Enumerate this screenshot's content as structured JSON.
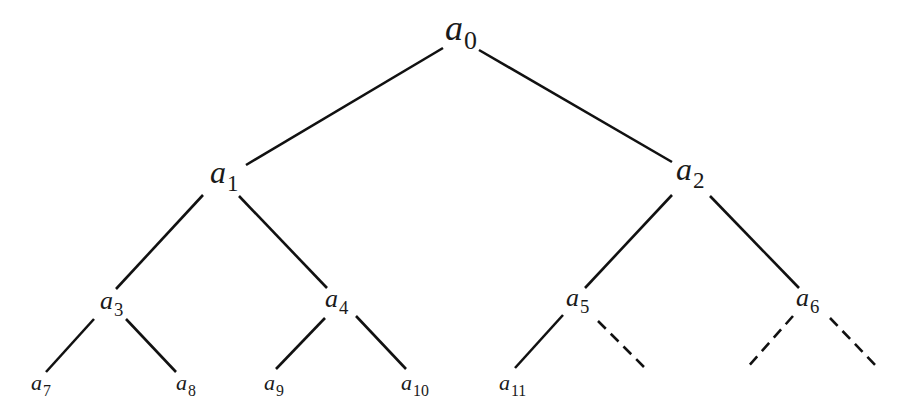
{
  "diagram": {
    "type": "binary-tree",
    "line_color": "#111111",
    "nodes": [
      {
        "id": "a0",
        "base": "a",
        "sub": "0",
        "x": 445,
        "y": 10,
        "size": 36
      },
      {
        "id": "a1",
        "base": "a",
        "sub": "1",
        "x": 210,
        "y": 156,
        "size": 32
      },
      {
        "id": "a2",
        "base": "a",
        "sub": "2",
        "x": 676,
        "y": 153,
        "size": 32
      },
      {
        "id": "a3",
        "base": "a",
        "sub": "3",
        "x": 100,
        "y": 288,
        "size": 26
      },
      {
        "id": "a4",
        "base": "a",
        "sub": "4",
        "x": 325,
        "y": 286,
        "size": 26
      },
      {
        "id": "a5",
        "base": "a",
        "sub": "5",
        "x": 566,
        "y": 285,
        "size": 26
      },
      {
        "id": "a6",
        "base": "a",
        "sub": "6",
        "x": 796,
        "y": 285,
        "size": 26
      },
      {
        "id": "a7",
        "base": "a",
        "sub": "7",
        "x": 31,
        "y": 372,
        "size": 22
      },
      {
        "id": "a8",
        "base": "a",
        "sub": "8",
        "x": 176,
        "y": 372,
        "size": 22
      },
      {
        "id": "a9",
        "base": "a",
        "sub": "9",
        "x": 264,
        "y": 372,
        "size": 22
      },
      {
        "id": "a10",
        "base": "a",
        "sub": "10",
        "x": 401,
        "y": 372,
        "size": 22
      },
      {
        "id": "a11",
        "base": "a",
        "sub": "11",
        "x": 499,
        "y": 372,
        "size": 22
      }
    ],
    "edges": [
      {
        "from": "a0",
        "to": "a1",
        "style": "solid",
        "x1": 443,
        "y1": 48,
        "x2": 246,
        "y2": 165
      },
      {
        "from": "a0",
        "to": "a2",
        "style": "solid",
        "x1": 479,
        "y1": 50,
        "x2": 672,
        "y2": 162
      },
      {
        "from": "a1",
        "to": "a3",
        "style": "solid",
        "x1": 203,
        "y1": 195,
        "x2": 116,
        "y2": 289
      },
      {
        "from": "a1",
        "to": "a4",
        "style": "solid",
        "x1": 239,
        "y1": 196,
        "x2": 327,
        "y2": 288
      },
      {
        "from": "a2",
        "to": "a5",
        "style": "solid",
        "x1": 672,
        "y1": 195,
        "x2": 585,
        "y2": 288
      },
      {
        "from": "a2",
        "to": "a6",
        "style": "solid",
        "x1": 710,
        "y1": 196,
        "x2": 799,
        "y2": 288
      },
      {
        "from": "a3",
        "to": "a7",
        "style": "solid",
        "x1": 94,
        "y1": 319,
        "x2": 46,
        "y2": 372
      },
      {
        "from": "a3",
        "to": "a8",
        "style": "solid",
        "x1": 126,
        "y1": 319,
        "x2": 176,
        "y2": 372
      },
      {
        "from": "a4",
        "to": "a9",
        "style": "solid",
        "x1": 325,
        "y1": 318,
        "x2": 276,
        "y2": 369
      },
      {
        "from": "a4",
        "to": "a10",
        "style": "solid",
        "x1": 356,
        "y1": 316,
        "x2": 406,
        "y2": 369
      },
      {
        "from": "a5",
        "to": "a11",
        "style": "solid",
        "x1": 563,
        "y1": 315,
        "x2": 515,
        "y2": 368
      },
      {
        "from": "a5",
        "to": null,
        "style": "dashed",
        "x1": 598,
        "y1": 321,
        "x2": 645,
        "y2": 368
      },
      {
        "from": "a6",
        "to": null,
        "style": "dashed",
        "x1": 793,
        "y1": 316,
        "x2": 747,
        "y2": 368
      },
      {
        "from": "a6",
        "to": null,
        "style": "dashed",
        "x1": 830,
        "y1": 318,
        "x2": 878,
        "y2": 368
      }
    ]
  }
}
